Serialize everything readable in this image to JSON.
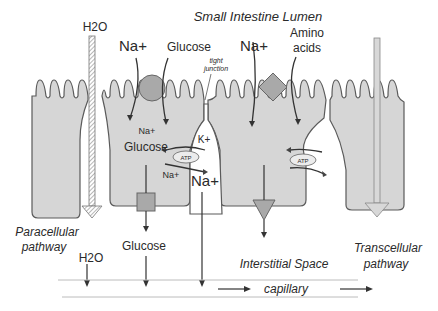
{
  "title": "Small Intestine Lumen",
  "labels": {
    "h2o_top": "H2O",
    "na_left": "Na+",
    "glucose_top": "Glucose",
    "tight_junction_1": "tight",
    "tight_junction_2": "junction",
    "na_right": "Na+",
    "amino_1": "Amino",
    "amino_2": "acids",
    "cell_na": "Na+",
    "cell_glucose": "Glucose",
    "k_plus": "K+",
    "atp_left": "ATP",
    "atp_right": "ATP",
    "na_small": "Na+",
    "na_big": "Na+",
    "paracellular_1": "Paracellular",
    "paracellular_2": "pathway",
    "h2o_bottom": "H2O",
    "glucose_bottom": "Glucose",
    "interstitial": "Interstitial Space",
    "transcellular_1": "Transcellular",
    "transcellular_2": "pathway",
    "capillary": "capillary"
  },
  "colors": {
    "cell_fill": "#d6d6d6",
    "transporter_fill": "#a9a9a9",
    "outline": "#5a5a5a",
    "text": "#2a2a2a"
  }
}
